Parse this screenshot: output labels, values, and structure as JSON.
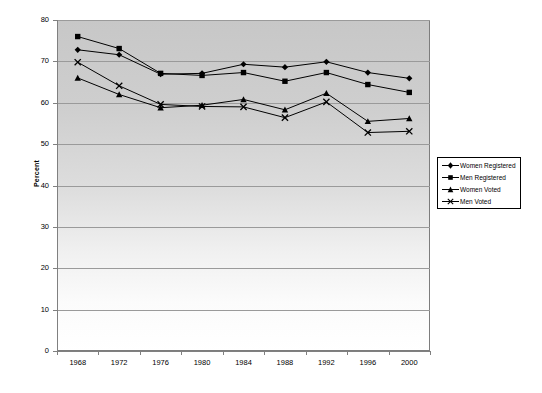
{
  "chart_data": {
    "type": "line",
    "title": "",
    "xlabel": "",
    "ylabel": "Percent",
    "categories": [
      "1968",
      "1972",
      "1976",
      "1980",
      "1984",
      "1988",
      "1992",
      "1996",
      "2000"
    ],
    "ylim": [
      0,
      80
    ],
    "ytick_step": 10,
    "yticks": [
      "0",
      "10",
      "20",
      "30",
      "40",
      "50",
      "60",
      "70",
      "80"
    ],
    "grid": true,
    "grid_axis": "y",
    "legend_position": "right-middle",
    "series": [
      {
        "name": "Women Registered",
        "marker": "diamond",
        "color": "#000000",
        "values": [
          72.8,
          71.6,
          66.9,
          67.1,
          69.3,
          68.6,
          69.9,
          67.3,
          65.9
        ]
      },
      {
        "name": "Men Registered",
        "marker": "square",
        "color": "#000000",
        "values": [
          76.0,
          73.1,
          67.1,
          66.6,
          67.3,
          65.2,
          67.3,
          64.4,
          62.5
        ]
      },
      {
        "name": "Women Voted",
        "marker": "triangle",
        "color": "#000000",
        "values": [
          66.0,
          62.0,
          58.8,
          59.4,
          60.8,
          58.3,
          62.3,
          55.5,
          56.2
        ]
      },
      {
        "name": "Men Voted",
        "marker": "cross",
        "color": "#000000",
        "values": [
          69.8,
          64.1,
          59.6,
          59.1,
          59.0,
          56.4,
          60.2,
          52.8,
          53.1
        ]
      }
    ]
  },
  "legend": {
    "items": [
      {
        "label": "Women Registered"
      },
      {
        "label": "Men Registered"
      },
      {
        "label": "Women Voted"
      },
      {
        "label": "Men Voted"
      }
    ]
  },
  "style": {
    "plot_bg_top": "#c9c9c9",
    "plot_bg_bottom": "#ffffff",
    "axis_color": "#808080",
    "grid_color": "#9a9a9a",
    "series_color": "#000000",
    "page_bg": "#ffffff"
  }
}
